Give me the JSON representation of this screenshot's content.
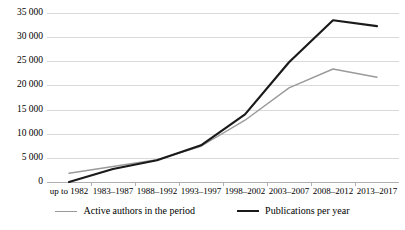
{
  "chart_data": {
    "type": "line",
    "title": "",
    "xlabel": "",
    "ylabel": "",
    "categories": [
      "up to 1982",
      "1983–1987",
      "1988–1992",
      "1993–1997",
      "1998–2002",
      "2003–2007",
      "2008–2012",
      "2013–2017"
    ],
    "series": [
      {
        "name": "Active authors in the period",
        "color": "#9a9a9a",
        "values": [
          1800,
          3200,
          4600,
          7400,
          12800,
          19500,
          23400,
          21700
        ]
      },
      {
        "name": "Publications per year",
        "color": "#1a1a1a",
        "values": [
          0,
          2700,
          4500,
          7600,
          14000,
          24800,
          33500,
          32300
        ]
      }
    ],
    "ylim": [
      0,
      35000
    ],
    "yticks": [
      0,
      5000,
      10000,
      15000,
      20000,
      25000,
      30000,
      35000
    ],
    "ytick_labels": [
      "0",
      "5 000",
      "10 000",
      "15 000",
      "20 000",
      "25 000",
      "30 000",
      "35 000"
    ],
    "grid": true,
    "legend_position": "bottom"
  },
  "legend": {
    "entries": [
      {
        "label": "Active authors in the period"
      },
      {
        "label": "Publications per year"
      }
    ]
  },
  "colors": {
    "authors_line": "#9a9a9a",
    "publications_line": "#1a1a1a",
    "gridline": "#d9d9d9",
    "axis": "#b0b0b0",
    "background": "#ffffff"
  }
}
